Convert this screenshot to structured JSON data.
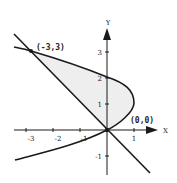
{
  "figure": {
    "x_axis_label": "X",
    "y_axis_label": "Y",
    "x_ticks": [
      "-3",
      "-2",
      "-1",
      "1"
    ],
    "y_ticks": [
      "3",
      "2",
      "1",
      "-1"
    ],
    "points": [
      {
        "label": "(-3,3)",
        "x": -3,
        "y": 3
      },
      {
        "label": "(0,0)",
        "x": 0,
        "y": 0
      }
    ],
    "curves": [
      {
        "name": "parabola",
        "equation": "x = 2y - y^2"
      },
      {
        "name": "line",
        "equation": "y = -x"
      }
    ],
    "shaded_region": "between parabola and line, from y=0 to y=3",
    "colors": {
      "stroke": "#1a1a1a",
      "shade": "#ececec"
    }
  }
}
